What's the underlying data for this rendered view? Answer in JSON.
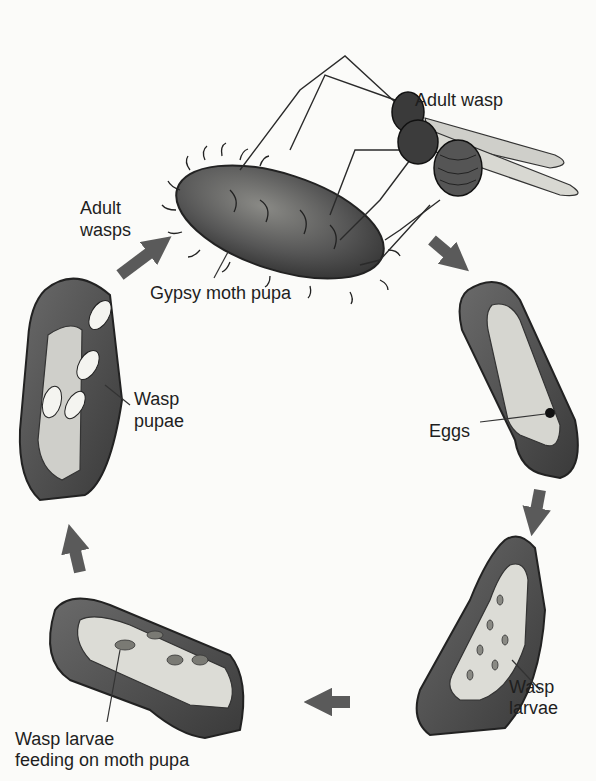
{
  "diagram": {
    "type": "life-cycle",
    "stages": [
      {
        "id": "adult-wasp",
        "label": "Adult wasp"
      },
      {
        "id": "gypsy-moth-pupa",
        "label": "Gypsy moth pupa"
      },
      {
        "id": "eggs",
        "label": "Eggs"
      },
      {
        "id": "wasp-larvae",
        "label_line1": "Wasp",
        "label_line2": "larvae"
      },
      {
        "id": "larvae-feeding",
        "label_line1": "Wasp larvae",
        "label_line2": "feeding on moth pupa"
      },
      {
        "id": "wasp-pupae",
        "label_line1": "Wasp",
        "label_line2": "pupae"
      },
      {
        "id": "adult-wasps",
        "label_line1": "Adult",
        "label_line2": "wasps"
      }
    ],
    "arrows": [
      {
        "from": "adult-wasps",
        "to": "gypsy-moth-pupa",
        "direction": "up-right"
      },
      {
        "from": "gypsy-moth-pupa",
        "to": "eggs",
        "direction": "down-right"
      },
      {
        "from": "eggs",
        "to": "wasp-larvae",
        "direction": "down"
      },
      {
        "from": "wasp-larvae",
        "to": "larvae-feeding",
        "direction": "left"
      },
      {
        "from": "larvae-feeding",
        "to": "wasp-pupae",
        "direction": "up"
      }
    ],
    "colors": {
      "background": "#fbfbf9",
      "arrow": "#5a5a5a",
      "pupa_dark": "#4a4a4a",
      "pupa_mid": "#7a7a7a",
      "pupa_light": "#d8d8d2",
      "text": "#1e1e1e"
    }
  }
}
